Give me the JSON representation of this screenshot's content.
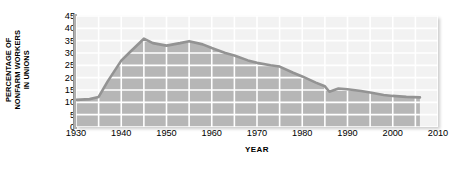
{
  "chart_data": {
    "type": "area",
    "title": "",
    "xlabel": "YEAR",
    "ylabel": "PERCENTAGE OF NONFARM WORKERS IN UNIONS",
    "ylabel_lines": [
      "PERCENTAGE OF",
      "NONFARM WORKERS",
      "IN UNIONS"
    ],
    "xlim": [
      1930,
      2010
    ],
    "ylim": [
      0,
      45
    ],
    "grid": true,
    "grid_color": "#ffffff",
    "legend": "none",
    "x_ticks": [
      1930,
      1940,
      1950,
      1960,
      1970,
      1980,
      1990,
      2000,
      2010
    ],
    "x_tick_labels": [
      "1930",
      "1940",
      "1950",
      "1960",
      "1970",
      "1980",
      "1990",
      "2000",
      "2010"
    ],
    "x_minor_step": 5,
    "y_ticks": [
      0,
      5,
      10,
      15,
      20,
      25,
      30,
      35,
      40,
      45
    ],
    "y_tick_labels": [
      "0",
      "5",
      "10",
      "15",
      "20",
      "25",
      "30",
      "35",
      "40",
      "45"
    ],
    "series": [
      {
        "name": "Percentage of nonfarm workers in unions",
        "line_color": "#939393",
        "fill_color": "#b6b6b6",
        "x": [
          1930,
          1933,
          1935,
          1937,
          1940,
          1942,
          1945,
          1947,
          1950,
          1953,
          1955,
          1958,
          1960,
          1963,
          1965,
          1968,
          1970,
          1973,
          1975,
          1978,
          1980,
          1983,
          1985,
          1986,
          1988,
          1990,
          1993,
          1995,
          1998,
          2000,
          2003,
          2006
        ],
        "values": [
          11.0,
          11.3,
          12.2,
          18.5,
          26.9,
          30.5,
          35.8,
          34.0,
          33.0,
          34.0,
          34.8,
          33.5,
          32.0,
          30.0,
          29.0,
          27.0,
          26.0,
          25.0,
          24.5,
          22.0,
          20.5,
          18.0,
          16.5,
          14.3,
          15.6,
          15.3,
          14.6,
          14.0,
          13.0,
          12.6,
          12.2,
          12.0
        ]
      }
    ]
  },
  "y_axis_title": {
    "line1": "PERCENTAGE OF",
    "line2": "NONFARM WORKERS",
    "line3": "IN UNIONS"
  },
  "x_axis_title": "YEAR"
}
